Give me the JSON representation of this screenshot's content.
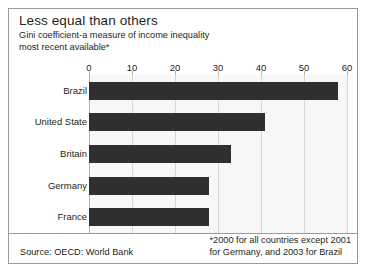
{
  "figure": {
    "title": "Less equal than others",
    "subtitle_line1": "Gini coefficient-a measure of income inequality",
    "subtitle_line2": "most recent available*",
    "source_note": "Source: OECD: World Bank",
    "asterisk_note_line1": "*2000 for all countries except 2001",
    "asterisk_note_line2": "for Germany, and 2003 for Brazil",
    "bar_color": "#2f2f2f",
    "plot_background": "#f7f7f7",
    "grid_color": "#d6d6d6",
    "border_color": "#9a9a9a"
  },
  "chart_data": {
    "type": "bar",
    "orientation": "horizontal",
    "title": "Less equal than others",
    "subtitle": "Gini coefficient-a measure of income inequality most recent available*",
    "xlabel": "",
    "ylabel": "",
    "categories": [
      "Brazil",
      "United State",
      "Britain",
      "Germany",
      "France"
    ],
    "values": [
      58,
      41,
      33,
      28,
      28
    ],
    "xlim": [
      0,
      60
    ],
    "xticks": [
      0,
      10,
      20,
      30,
      40,
      50,
      60
    ],
    "xtick_labels": [
      "0",
      "10",
      "20",
      "30",
      "40",
      "50",
      "60"
    ],
    "grid": true,
    "grid_axis": "x",
    "legend": false,
    "annotations": [
      "*2000 for all countries except 2001 for Germany, and 2003 for Brazil",
      "Source: OECD: World Bank"
    ]
  }
}
